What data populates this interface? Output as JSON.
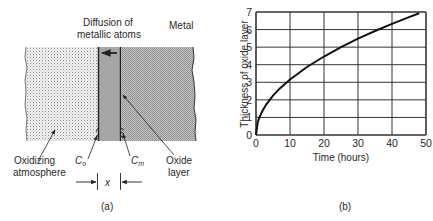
{
  "panel_a": {
    "caption": "(a)",
    "labels": {
      "diffusion_line1": "Diffusion of",
      "diffusion_line2": "metallic atoms",
      "metal": "Metal",
      "oxidizing_line1": "Oxidizing",
      "oxidizing_line2": "atmosphere",
      "c_o_main": "C",
      "c_o_sub": "o",
      "c_m_main": "C",
      "c_m_sub": "m",
      "oxide_line1": "Oxide",
      "oxide_line2": "layer",
      "thickness_symbol": "x"
    },
    "regions": [
      {
        "name": "oxidizing-atmosphere",
        "fill": "#e9e9e9"
      },
      {
        "name": "oxide-layer",
        "fill": "#a9a9a9"
      },
      {
        "name": "metal",
        "fill": "#b8b8b8"
      }
    ]
  },
  "panel_b": {
    "caption": "(b)"
  },
  "chart_data": {
    "type": "line",
    "title": "",
    "xlabel": "Time (hours)",
    "ylabel": "Thickness of oxide layer",
    "xlim": [
      0,
      50
    ],
    "ylim": [
      0,
      7
    ],
    "xticks": [
      0,
      10,
      20,
      30,
      40,
      50
    ],
    "yticks": [
      0,
      1,
      2,
      3,
      4,
      5,
      6,
      7
    ],
    "grid": true,
    "series": [
      {
        "name": "oxide thickness (parabolic growth)",
        "x": [
          0,
          0.5,
          1,
          2,
          3,
          5,
          7,
          10,
          15,
          20,
          25,
          30,
          35,
          40,
          45,
          48
        ],
        "y": [
          0,
          0.71,
          1.0,
          1.41,
          1.73,
          2.24,
          2.65,
          3.16,
          3.87,
          4.47,
          5.0,
          5.48,
          5.92,
          6.32,
          6.71,
          6.93
        ]
      }
    ]
  }
}
